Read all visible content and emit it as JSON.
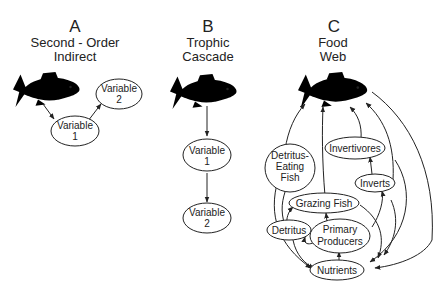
{
  "panels": [
    {
      "letter": "A",
      "title_lines": [
        "Second - Order",
        "Indirect"
      ],
      "nodes": [
        {
          "label_lines": [
            "Variable",
            "1"
          ]
        },
        {
          "label_lines": [
            "Variable",
            "2"
          ]
        }
      ]
    },
    {
      "letter": "B",
      "title_lines": [
        "Trophic",
        "Cascade"
      ],
      "nodes": [
        {
          "label_lines": [
            "Variable",
            "1"
          ]
        },
        {
          "label_lines": [
            "Variable",
            "2"
          ]
        }
      ]
    },
    {
      "letter": "C",
      "title_lines": [
        "Food",
        "Web"
      ],
      "nodes": {
        "detritus_eating_fish": {
          "label_lines": [
            "Detritus-",
            "Eating",
            "Fish"
          ]
        },
        "invertivores": {
          "label_lines": [
            "Invertivores"
          ]
        },
        "inverts": {
          "label_lines": [
            "Inverts"
          ]
        },
        "grazing_fish": {
          "label_lines": [
            "Grazing Fish"
          ]
        },
        "detritus": {
          "label_lines": [
            "Detritus"
          ]
        },
        "primary_producers": {
          "label_lines": [
            "Primary",
            "Producers"
          ]
        },
        "nutrients": {
          "label_lines": [
            "Nutrients"
          ]
        }
      }
    }
  ],
  "colors": {
    "stroke": "#222222",
    "background": "#ffffff"
  }
}
